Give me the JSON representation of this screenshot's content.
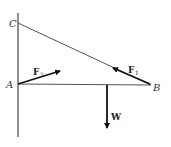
{
  "diagram": {
    "points": {
      "C": {
        "label": "C"
      },
      "A": {
        "label": "A"
      },
      "B": {
        "label": "B"
      }
    },
    "forces": {
      "F1": {
        "label": "F",
        "subscript": "1"
      },
      "F2": {
        "label": "F",
        "subscript": "2"
      },
      "W": {
        "label": "W"
      }
    },
    "colors": {
      "line": "#555555",
      "arrow": "#111111"
    }
  }
}
